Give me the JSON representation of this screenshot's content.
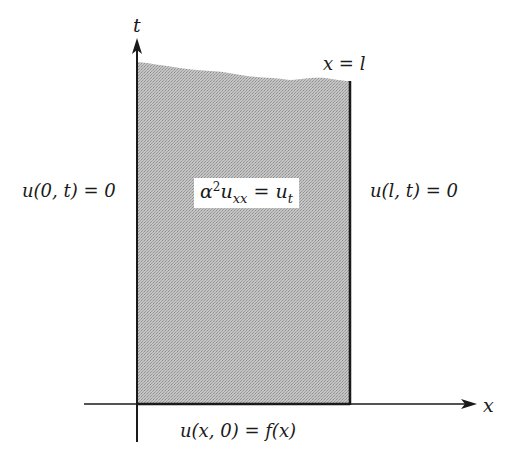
{
  "diagram": {
    "type": "heat-equation-boundary-value-problem",
    "axes": {
      "t_label": "t",
      "x_label": "x"
    },
    "right_boundary_label": "x = l",
    "left_boundary_condition": "u(0, t) = 0",
    "right_boundary_condition": "u(l, t) = 0",
    "pde": {
      "lhs_coef": "α",
      "lhs_exp": "2",
      "lhs_u": "u",
      "lhs_sub": "xx",
      "eq": "=",
      "rhs_u": "u",
      "rhs_sub": "t"
    },
    "initial_condition": "u(x, 0) = f(x)",
    "colors": {
      "region_fill": "#b9b9b9",
      "axis": "#1a1a1a",
      "background": "#ffffff"
    }
  }
}
